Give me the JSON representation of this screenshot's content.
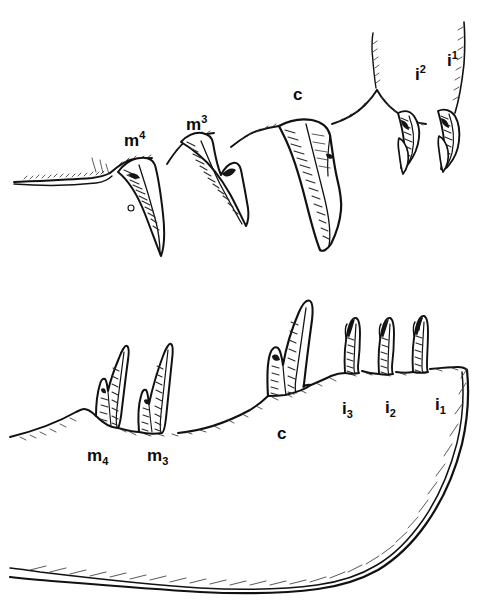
{
  "figure": {
    "background_color": "#ffffff",
    "ink_color": "#111111",
    "width": 487,
    "height": 614
  },
  "upper_jaw": {
    "name": "upper-jaw-dentition",
    "description": "Upper jaw tooth row in lateral view, teeth directed downward",
    "labels": [
      {
        "id": "upper-m4",
        "base": "m",
        "index": "4",
        "notation": "superscript",
        "text": "m4",
        "x": 124,
        "y": 132
      },
      {
        "id": "upper-m3",
        "base": "m",
        "index": "3",
        "notation": "superscript",
        "text": "m3",
        "x": 186,
        "y": 116
      },
      {
        "id": "upper-c",
        "base": "c",
        "index": "",
        "notation": "none",
        "text": "c",
        "x": 293,
        "y": 86
      },
      {
        "id": "upper-i2",
        "base": "i",
        "index": "2",
        "notation": "superscript",
        "text": "i2",
        "x": 415,
        "y": 66
      },
      {
        "id": "upper-i1",
        "base": "i",
        "index": "1",
        "notation": "superscript",
        "text": "i1",
        "x": 447,
        "y": 52
      }
    ]
  },
  "lower_jaw": {
    "name": "lower-jaw-mandible",
    "description": "Mandible in lateral view with tooth row directed upward",
    "labels": [
      {
        "id": "lower-m4",
        "base": "m",
        "index": "4",
        "notation": "subscript",
        "text": "m4",
        "x": 87,
        "y": 447
      },
      {
        "id": "lower-m3",
        "base": "m",
        "index": "3",
        "notation": "subscript",
        "text": "m3",
        "x": 147,
        "y": 447
      },
      {
        "id": "lower-c",
        "base": "c",
        "index": "",
        "notation": "none",
        "text": "c",
        "x": 277,
        "y": 425
      },
      {
        "id": "lower-i3",
        "base": "i",
        "index": "3",
        "notation": "subscript",
        "text": "i3",
        "x": 342,
        "y": 400
      },
      {
        "id": "lower-i2",
        "base": "i",
        "index": "2",
        "notation": "subscript",
        "text": "i2",
        "x": 385,
        "y": 399
      },
      {
        "id": "lower-i1",
        "base": "i",
        "index": "1",
        "notation": "subscript",
        "text": "i1",
        "x": 435,
        "y": 396
      }
    ]
  }
}
